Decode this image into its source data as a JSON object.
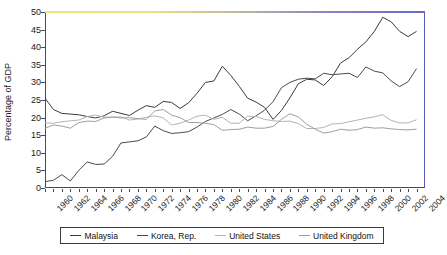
{
  "chart_data": {
    "type": "line",
    "title": "",
    "xlabel": "",
    "ylabel": "Percentage of GDP",
    "ylim": [
      0,
      50
    ],
    "yticks": [
      0,
      5,
      10,
      15,
      20,
      25,
      30,
      35,
      40,
      45,
      50
    ],
    "xlim": [
      1960,
      2005
    ],
    "x": [
      1960,
      1961,
      1962,
      1963,
      1964,
      1965,
      1966,
      1967,
      1968,
      1969,
      1970,
      1971,
      1972,
      1973,
      1974,
      1975,
      1976,
      1977,
      1978,
      1979,
      1980,
      1981,
      1982,
      1983,
      1984,
      1985,
      1986,
      1987,
      1988,
      1989,
      1990,
      1991,
      1992,
      1993,
      1994,
      1995,
      1996,
      1997,
      1998,
      1999,
      2000,
      2001,
      2002,
      2003,
      2004
    ],
    "xtick_labels": [
      "1960",
      "1962",
      "1964",
      "1966",
      "1968",
      "1970",
      "1972",
      "1974",
      "1976",
      "1978",
      "1980",
      "1982",
      "1984",
      "1986",
      "1988",
      "1990",
      "1992",
      "1994",
      "1996",
      "1998",
      "2000",
      "2002",
      "2004"
    ],
    "grid": false,
    "legend_position": "bottom",
    "series": [
      {
        "name": "Malaysia",
        "color": "#3a3a3a",
        "values": [
          25.5,
          22.3,
          21.2,
          21.0,
          20.8,
          20.3,
          19.9,
          20.5,
          21.8,
          21.2,
          20.6,
          22.1,
          23.4,
          22.9,
          24.6,
          24.3,
          22.6,
          24.2,
          26.9,
          30.0,
          30.4,
          34.6,
          32.0,
          28.9,
          25.5,
          24.4,
          22.9,
          19.5,
          22.0,
          25.6,
          29.6,
          30.9,
          30.7,
          29.1,
          31.6,
          35.5,
          37.0,
          39.4,
          41.5,
          44.5,
          48.5,
          47.2,
          44.5,
          43.0,
          44.5
        ]
      },
      {
        "name": "Korea, Rep.",
        "color": "#4a4a4a",
        "values": [
          1.8,
          2.2,
          3.8,
          2.0,
          5.0,
          7.4,
          6.7,
          6.8,
          9.0,
          12.8,
          13.1,
          13.4,
          14.5,
          17.6,
          16.3,
          15.5,
          15.7,
          16.0,
          17.3,
          18.9,
          19.9,
          20.9,
          22.3,
          21.0,
          19.1,
          20.5,
          22.1,
          24.5,
          28.5,
          30.0,
          30.9,
          31.2,
          31.0,
          32.6,
          32.2,
          32.4,
          32.6,
          31.4,
          34.4,
          33.2,
          32.7,
          30.4,
          28.8,
          30.2,
          33.9
        ]
      },
      {
        "name": "United States",
        "color": "#b4b4b4",
        "values": [
          18.5,
          18.4,
          18.8,
          19.1,
          19.3,
          20.3,
          20.7,
          20.1,
          20.1,
          20.2,
          19.3,
          19.6,
          20.1,
          20.5,
          19.9,
          17.9,
          18.4,
          19.3,
          20.4,
          20.7,
          19.5,
          20.1,
          18.4,
          18.4,
          20.4,
          20.3,
          19.5,
          19.1,
          18.9,
          19.0,
          18.3,
          16.9,
          16.9,
          17.2,
          18.2,
          18.3,
          18.8,
          19.3,
          19.8,
          20.2,
          20.8,
          19.2,
          18.5,
          18.5,
          19.4
        ]
      },
      {
        "name": "United Kingdom",
        "color": "#9e9e9e",
        "values": [
          17.0,
          17.9,
          17.6,
          17.0,
          18.6,
          19.0,
          18.9,
          19.9,
          20.2,
          19.9,
          20.0,
          19.7,
          19.5,
          21.9,
          22.3,
          20.7,
          20.0,
          18.6,
          18.6,
          18.4,
          18.0,
          16.4,
          16.6,
          16.7,
          17.3,
          17.0,
          17.0,
          17.5,
          19.5,
          21.1,
          20.2,
          18.1,
          16.7,
          15.6,
          16.0,
          16.7,
          16.4,
          16.6,
          17.3,
          17.0,
          17.1,
          16.8,
          16.6,
          16.5,
          16.7
        ]
      }
    ]
  },
  "legend": {
    "items": [
      {
        "label": "Malaysia",
        "color": "#3a3a3a"
      },
      {
        "label": "Korea, Rep.",
        "color": "#4a4a4a"
      },
      {
        "label": "United States",
        "color": "#b4b4b4"
      },
      {
        "label": "United Kingdom",
        "color": "#9e9e9e"
      }
    ]
  },
  "axes": {
    "y_axis_title": "Percentage of GDP"
  }
}
